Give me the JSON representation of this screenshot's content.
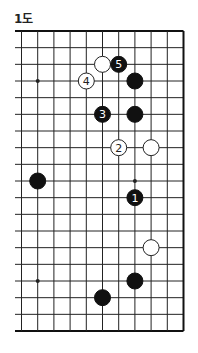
{
  "diagram": {
    "title": "1도",
    "board": {
      "columns": 11,
      "rows": 19,
      "origin_x": 21.5,
      "origin_y": 31,
      "col_spacing": 16.2,
      "row_spacing": 16.667,
      "left_extension": 6.5,
      "edges": {
        "top": true,
        "right": true,
        "bottom": true,
        "left": false
      },
      "line_color": "#222222",
      "edge_color": "#111111"
    },
    "star_points": [
      {
        "col": 1,
        "row": 3
      },
      {
        "col": 7,
        "row": 9
      },
      {
        "col": 1,
        "row": 15
      }
    ],
    "stones": [
      {
        "color": "white",
        "col": 5,
        "row": 2,
        "label": ""
      },
      {
        "color": "black",
        "col": 6,
        "row": 2,
        "label": "5"
      },
      {
        "color": "white",
        "col": 4,
        "row": 3,
        "label": "4"
      },
      {
        "color": "black",
        "col": 7,
        "row": 3,
        "label": ""
      },
      {
        "color": "black",
        "col": 5,
        "row": 5,
        "label": "3"
      },
      {
        "color": "black",
        "col": 7,
        "row": 5,
        "label": ""
      },
      {
        "color": "white",
        "col": 6,
        "row": 7,
        "label": "2"
      },
      {
        "color": "white",
        "col": 8,
        "row": 7,
        "label": ""
      },
      {
        "color": "black",
        "col": 1,
        "row": 9,
        "label": ""
      },
      {
        "color": "black",
        "col": 7,
        "row": 10,
        "label": "1"
      },
      {
        "color": "white",
        "col": 8,
        "row": 13,
        "label": ""
      },
      {
        "color": "black",
        "col": 7,
        "row": 15,
        "label": ""
      },
      {
        "color": "black",
        "col": 5,
        "row": 16,
        "label": ""
      }
    ],
    "colors": {
      "black_stone": "#111111",
      "white_stone": "#ffffff",
      "white_stone_border": "#222222",
      "label_on_black": "#ffffff",
      "label_on_white": "#222222"
    }
  }
}
